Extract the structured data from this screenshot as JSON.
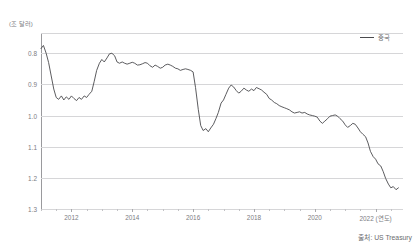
{
  "title": "",
  "unit_label": "(조 달러)",
  "legend": {
    "label": "중국",
    "color": "#4a4a4d"
  },
  "source": "출처: US Treasury",
  "axis": {
    "y_ticks": [
      "1.3",
      "1.2",
      "1.1",
      "1.0",
      "0.9",
      "0.8"
    ],
    "x_ticks": [
      "2012",
      "2014",
      "2016",
      "2018",
      "2020",
      "2022 (연도)"
    ]
  },
  "chart_data": {
    "type": "line",
    "title": "",
    "xlabel": "(연도)",
    "ylabel": "(조 달러)",
    "ylim": [
      0.8,
      1.365
    ],
    "xlim": [
      2011.0,
      2022.9
    ],
    "grid": true,
    "legend_position": "top-right",
    "yticks": [
      0.8,
      0.9,
      1.0,
      1.1,
      1.2,
      1.3
    ],
    "xticks": [
      2012,
      2014,
      2016,
      2018,
      2020,
      2022
    ],
    "series": [
      {
        "name": "중국",
        "color": "#4a4a4d",
        "x": [
          2011.0,
          2011.08,
          2011.17,
          2011.25,
          2011.33,
          2011.42,
          2011.5,
          2011.58,
          2011.67,
          2011.75,
          2011.83,
          2011.92,
          2012.0,
          2012.08,
          2012.17,
          2012.25,
          2012.33,
          2012.42,
          2012.5,
          2012.58,
          2012.67,
          2012.75,
          2012.83,
          2012.92,
          2013.0,
          2013.08,
          2013.17,
          2013.25,
          2013.33,
          2013.42,
          2013.5,
          2013.58,
          2013.67,
          2013.75,
          2013.83,
          2013.92,
          2014.0,
          2014.08,
          2014.17,
          2014.25,
          2014.33,
          2014.42,
          2014.5,
          2014.58,
          2014.67,
          2014.75,
          2014.83,
          2014.92,
          2015.0,
          2015.08,
          2015.17,
          2015.25,
          2015.33,
          2015.42,
          2015.5,
          2015.58,
          2015.67,
          2015.75,
          2015.83,
          2015.92,
          2016.0,
          2016.08,
          2016.17,
          2016.25,
          2016.33,
          2016.42,
          2016.5,
          2016.58,
          2016.67,
          2016.75,
          2016.83,
          2016.92,
          2017.0,
          2017.08,
          2017.17,
          2017.25,
          2017.33,
          2017.42,
          2017.5,
          2017.58,
          2017.67,
          2017.75,
          2017.83,
          2017.92,
          2018.0,
          2018.08,
          2018.17,
          2018.25,
          2018.33,
          2018.42,
          2018.5,
          2018.58,
          2018.67,
          2018.75,
          2018.83,
          2018.92,
          2019.0,
          2019.08,
          2019.17,
          2019.25,
          2019.33,
          2019.42,
          2019.5,
          2019.58,
          2019.67,
          2019.75,
          2019.83,
          2019.92,
          2020.0,
          2020.08,
          2020.17,
          2020.25,
          2020.33,
          2020.42,
          2020.5,
          2020.58,
          2020.67,
          2020.75,
          2020.83,
          2020.92,
          2021.0,
          2021.08,
          2021.17,
          2021.25,
          2021.33,
          2021.42,
          2021.5,
          2021.58,
          2021.67,
          2021.75,
          2021.83,
          2021.92,
          2022.0,
          2022.08,
          2022.17,
          2022.25,
          2022.33,
          2022.42,
          2022.5,
          2022.58,
          2022.67,
          2022.75
        ],
        "y": [
          1.315,
          1.325,
          1.3,
          1.27,
          1.23,
          1.185,
          1.158,
          1.152,
          1.163,
          1.15,
          1.16,
          1.152,
          1.163,
          1.155,
          1.148,
          1.158,
          1.152,
          1.163,
          1.158,
          1.168,
          1.178,
          1.21,
          1.245,
          1.268,
          1.28,
          1.272,
          1.285,
          1.298,
          1.3,
          1.292,
          1.272,
          1.268,
          1.272,
          1.268,
          1.265,
          1.268,
          1.271,
          1.268,
          1.262,
          1.263,
          1.266,
          1.27,
          1.268,
          1.26,
          1.255,
          1.262,
          1.258,
          1.252,
          1.255,
          1.262,
          1.265,
          1.262,
          1.258,
          1.252,
          1.25,
          1.245,
          1.248,
          1.25,
          1.248,
          1.245,
          1.24,
          1.19,
          1.12,
          1.068,
          1.052,
          1.058,
          1.048,
          1.06,
          1.072,
          1.09,
          1.11,
          1.14,
          1.15,
          1.168,
          1.188,
          1.198,
          1.192,
          1.18,
          1.172,
          1.178,
          1.188,
          1.182,
          1.178,
          1.185,
          1.18,
          1.19,
          1.186,
          1.182,
          1.175,
          1.168,
          1.155,
          1.15,
          1.142,
          1.138,
          1.132,
          1.128,
          1.125,
          1.122,
          1.118,
          1.112,
          1.108,
          1.11,
          1.112,
          1.108,
          1.11,
          1.105,
          1.102,
          1.1,
          1.098,
          1.095,
          1.082,
          1.075,
          1.082,
          1.09,
          1.098,
          1.1,
          1.102,
          1.098,
          1.09,
          1.082,
          1.07,
          1.062,
          1.068,
          1.075,
          1.072,
          1.06,
          1.048,
          1.04,
          1.032,
          1.012,
          0.985,
          0.968,
          0.96,
          0.945,
          0.938,
          0.92,
          0.898,
          0.88,
          0.868,
          0.872,
          0.862,
          0.868
        ]
      }
    ]
  }
}
